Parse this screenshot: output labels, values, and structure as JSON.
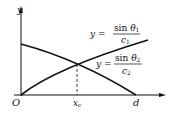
{
  "axes": {
    "y_label": "y",
    "x_origin_label": "O",
    "x_tick_labels": [
      "x",
      "d"
    ],
    "x_tick_sub": "c"
  },
  "curves": [
    {
      "name": "increasing",
      "eq_lhs": "y =",
      "numerator": "sin θ",
      "num_sub": "1",
      "denominator": "c",
      "den_sub": "1"
    },
    {
      "name": "decreasing",
      "eq_lhs": "y =",
      "numerator": "sin θ",
      "num_sub": "2",
      "denominator": "c",
      "den_sub": "2"
    }
  ],
  "intersection_label": "x_c",
  "colors": {
    "ink": "#111111",
    "background": "#ffffff"
  }
}
